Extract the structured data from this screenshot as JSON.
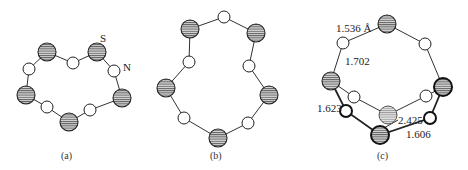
{
  "figure": {
    "panels": [
      {
        "id": "a",
        "caption": "(a)",
        "atom_labels": {
          "S": "S",
          "N": "N"
        }
      },
      {
        "id": "b",
        "caption": "(b)"
      },
      {
        "id": "c",
        "caption": "(c)",
        "bond_lengths": {
          "b1": "1.536 Å",
          "b2": "1.702",
          "b3": "1.623",
          "b4": "2.425",
          "b5": "1.606"
        }
      }
    ],
    "legend": {
      "hatched_large_circle": "S atom",
      "open_small_circle": "N atom"
    },
    "colors": {
      "line": "#222222",
      "hatch": "#555555",
      "background": "#ffffff"
    }
  }
}
